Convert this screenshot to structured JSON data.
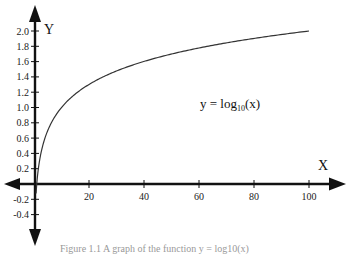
{
  "chart_data": {
    "type": "line",
    "title": "",
    "xlabel": "X",
    "ylabel": "Y",
    "annotation": "y = log10(x)",
    "annotation_parts": {
      "prefix": "y = log",
      "sub": "10",
      "suffix": "(x)"
    },
    "xlim": [
      0,
      100
    ],
    "ylim": [
      -0.4,
      2.0
    ],
    "x_ticks": [
      20,
      40,
      60,
      80,
      100
    ],
    "y_ticks": [
      "2.0",
      "1.8",
      "1.6",
      "1.4",
      "1.2",
      "1.0",
      "0.8",
      "0.6",
      "0.4",
      "0.2",
      "-0.2",
      "-0.4"
    ],
    "y_tick_values": [
      2.0,
      1.8,
      1.6,
      1.4,
      1.2,
      1.0,
      0.8,
      0.6,
      0.4,
      0.2,
      -0.2,
      -0.4
    ],
    "grid": false,
    "legend": null,
    "series": [
      {
        "name": "log10(x)",
        "x": [
          1,
          2,
          5,
          10,
          20,
          30,
          40,
          50,
          60,
          70,
          80,
          90,
          100
        ],
        "values": [
          0,
          0.301,
          0.699,
          1.0,
          1.301,
          1.477,
          1.602,
          1.699,
          1.778,
          1.845,
          1.903,
          1.954,
          2.0
        ]
      }
    ]
  },
  "caption": "Figure 1.1  A graph of the function y = log10(x)",
  "colors": {
    "axis": "#111111",
    "curve": "#333333"
  }
}
